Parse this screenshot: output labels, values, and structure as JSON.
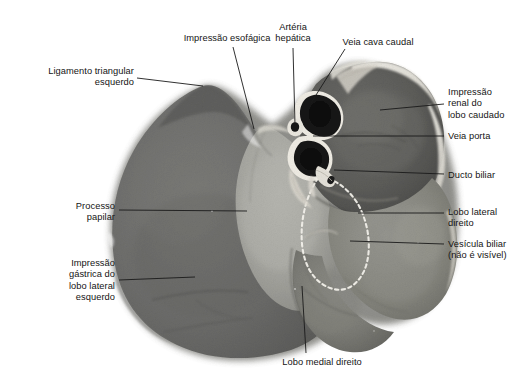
{
  "figure": {
    "kind": "anatomical-photograph",
    "language": "pt-BR",
    "background_color": "#ffffff",
    "text_color": "#141414",
    "leader_line_color": "#1a1a1a",
    "gallbladder_outline_color": "#f2f2ee",
    "specimen_tones": {
      "left_lateral_lobe_dark": "#6f6f6f",
      "papillary_process_light": "#a9a9a4",
      "caudate_lobe_dark": "#5e5e5e",
      "right_lobes_mid": "#8a8a86",
      "highlight_rim": "#e8e6df",
      "vessel_lumen_dark": "#1f1f1f"
    }
  },
  "labels": [
    {
      "id": "ligamento-triangular-esquerdo",
      "lines": [
        "Ligamento triangular",
        "esquerdo"
      ],
      "align": "right",
      "text_x": 134,
      "text_y": 66,
      "leader": [
        [
          137,
          78
        ],
        [
          203,
          86
        ]
      ]
    },
    {
      "id": "impressao-esofagica",
      "lines": [
        "Impressão esofágica"
      ],
      "align": "center",
      "text_x": 227,
      "text_y": 33,
      "leader": [
        [
          233,
          47
        ],
        [
          254,
          129
        ]
      ]
    },
    {
      "id": "arteria-hepatica",
      "lines": [
        "Artéria",
        "hepática"
      ],
      "align": "center",
      "text_x": 293,
      "text_y": 22,
      "leader": [
        [
          293,
          48
        ],
        [
          295,
          125
        ]
      ]
    },
    {
      "id": "veia-cava-caudal",
      "lines": [
        "Veia cava caudal"
      ],
      "align": "center",
      "text_x": 378,
      "text_y": 37,
      "leader": [
        [
          345,
          49
        ],
        [
          311,
          103
        ]
      ]
    },
    {
      "id": "impressao-renal-lobo-caudado",
      "lines": [
        "Impressão",
        "renal do",
        "lobo caudado"
      ],
      "align": "left",
      "text_x": 448,
      "text_y": 87,
      "leader": [
        [
          444,
          104
        ],
        [
          380,
          110
        ]
      ]
    },
    {
      "id": "veia-porta",
      "lines": [
        "Veia porta"
      ],
      "align": "left",
      "text_x": 448,
      "text_y": 131,
      "leader": [
        [
          444,
          136
        ],
        [
          313,
          136
        ]
      ]
    },
    {
      "id": "ducto-biliar",
      "lines": [
        "Ducto biliar"
      ],
      "align": "left",
      "text_x": 448,
      "text_y": 170,
      "leader": [
        [
          444,
          174
        ],
        [
          334,
          170
        ]
      ]
    },
    {
      "id": "lobo-lateral-direito",
      "lines": [
        "Lobo lateral",
        "direito"
      ],
      "align": "left",
      "text_x": 448,
      "text_y": 207,
      "leader": [
        [
          444,
          213
        ],
        [
          358,
          213
        ]
      ]
    },
    {
      "id": "vesicula-biliar",
      "lines": [
        "Vesícula biliar",
        "(não é visível)"
      ],
      "align": "left",
      "text_x": 448,
      "text_y": 239,
      "leader": [
        [
          444,
          244
        ],
        [
          350,
          241
        ]
      ]
    },
    {
      "id": "processo-papilar",
      "lines": [
        "Processo",
        "papilar"
      ],
      "align": "right",
      "text_x": 115,
      "text_y": 201,
      "leader": [
        [
          119,
          210
        ],
        [
          247,
          211
        ]
      ]
    },
    {
      "id": "impressao-gastrica-lobo-lateral-esquerdo",
      "lines": [
        "Impressão",
        "gástrica do",
        "lobo lateral",
        "esquerdo"
      ],
      "align": "right",
      "text_x": 115,
      "text_y": 258,
      "leader": [
        [
          119,
          280
        ],
        [
          195,
          277
        ]
      ]
    },
    {
      "id": "lobo-medial-direito",
      "lines": [
        "Lobo medial direito"
      ],
      "align": "center",
      "text_x": 322,
      "text_y": 357,
      "leader": [
        [
          306,
          353
        ],
        [
          302,
          286
        ]
      ]
    }
  ]
}
